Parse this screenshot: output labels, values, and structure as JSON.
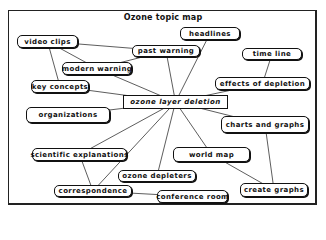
{
  "diagram": {
    "title": "Ozone topic map",
    "center": {
      "id": "center",
      "label": "ozone layer deletion"
    },
    "nodes": [
      {
        "id": "video_clips",
        "label": "video clips"
      },
      {
        "id": "past_warning",
        "label": "past warning"
      },
      {
        "id": "headlines",
        "label": "headlines"
      },
      {
        "id": "modern_warning",
        "label": "modern warning"
      },
      {
        "id": "time_line",
        "label": "time line"
      },
      {
        "id": "key_concepts",
        "label": "key concepts"
      },
      {
        "id": "effects_of_depletion",
        "label": "effects of depletion"
      },
      {
        "id": "organizations",
        "label": "organizations"
      },
      {
        "id": "charts_and_graphs",
        "label": "charts and graphs"
      },
      {
        "id": "world_map",
        "label": "world map"
      },
      {
        "id": "scientific_explanations",
        "label": "scientific explanations"
      },
      {
        "id": "ozone_depleters",
        "label": "ozone depleters"
      },
      {
        "id": "correspondence",
        "label": "correspondence"
      },
      {
        "id": "conference_room",
        "label": "conference room"
      },
      {
        "id": "create_graphs",
        "label": "create graphs"
      }
    ],
    "edges": [
      [
        "video_clips",
        "past_warning"
      ],
      [
        "video_clips",
        "modern_warning"
      ],
      [
        "video_clips",
        "key_concepts"
      ],
      [
        "modern_warning",
        "past_warning"
      ],
      [
        "modern_warning",
        "center"
      ],
      [
        "past_warning",
        "center"
      ],
      [
        "headlines",
        "center"
      ],
      [
        "key_concepts",
        "center"
      ],
      [
        "effects_of_depletion",
        "center"
      ],
      [
        "time_line",
        "effects_of_depletion"
      ],
      [
        "organizations",
        "center"
      ],
      [
        "charts_and_graphs",
        "center"
      ],
      [
        "charts_and_graphs",
        "create_graphs"
      ],
      [
        "world_map",
        "center"
      ],
      [
        "world_map",
        "create_graphs"
      ],
      [
        "scientific_explanations",
        "center"
      ],
      [
        "ozone_depleters",
        "center"
      ],
      [
        "correspondence",
        "center"
      ],
      [
        "correspondence",
        "scientific_explanations"
      ],
      [
        "correspondence",
        "conference_room"
      ]
    ]
  }
}
